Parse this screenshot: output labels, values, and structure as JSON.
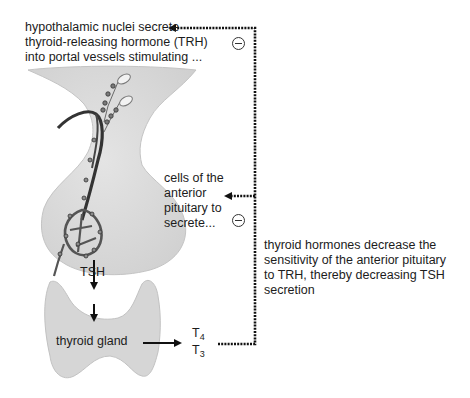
{
  "labels": {
    "hypothalamus": [
      "hypothalamic nuclei secrete",
      "thyroid-releasing hormone (TRH)",
      "into portal vessels stimulating ..."
    ],
    "anterior_pituitary": [
      "cells of the",
      "anterior",
      "pituitary to",
      "secrete..."
    ],
    "feedback_note": [
      "thyroid hormones decrease the",
      "sensitivity of the anterior pituitary",
      "to TRH, thereby decreasing TSH",
      "secretion"
    ],
    "tsh": "TSH",
    "thyroid_gland": "thyroid gland",
    "t4": {
      "base": "T",
      "sub": "4"
    },
    "t3": {
      "base": "T",
      "sub": "3"
    }
  },
  "inhibition_symbols": [
    "⊖",
    "⊖"
  ],
  "colors": {
    "tissue_fill": "#d9d9d9",
    "tissue_edge": "#bdbdbd",
    "vessel": "#3a3a3a",
    "arrow": "#111111"
  }
}
